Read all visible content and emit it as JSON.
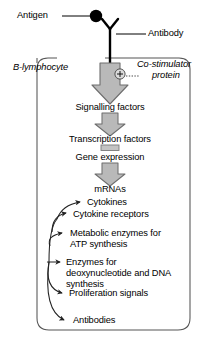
{
  "diagram": {
    "title_alt": "B-lymphocyte antigen-antibody signalling cascade",
    "cell_label": "B-lymphocyte",
    "antigen_label": "Antigen",
    "antibody_label": "Antibody",
    "costimulator_label_line1": "Co-stimulator",
    "costimulator_label_line2": "protein",
    "plus_symbol": "+",
    "cascade": [
      {
        "id": "signalling-factors",
        "label": "Signalling factors"
      },
      {
        "id": "transcription-factors",
        "label": "Transcription factors"
      },
      {
        "id": "gene-expression",
        "label": "Gene expression"
      },
      {
        "id": "mrnas",
        "label": "mRNAs"
      }
    ],
    "products": [
      {
        "id": "cytokines",
        "label": "Cytokines"
      },
      {
        "id": "cytokine-receptors",
        "label": "Cytokine receptors"
      },
      {
        "id": "metabolic-enzymes",
        "label": "Metabolic enzymes for ATP synthesis"
      },
      {
        "id": "dna-enzymes",
        "label": "Enzymes for deoxynucleo­tide and DNA synthesis"
      },
      {
        "id": "proliferation-signals",
        "label": "Proliferation signals"
      },
      {
        "id": "antibodies",
        "label": "Antibodies"
      }
    ],
    "colors": {
      "arrow_fill": "#b9b9b9",
      "arrow_stroke": "#6e6e6e",
      "cell_border": "#555555",
      "line": "#000000",
      "text": "#000000"
    }
  }
}
